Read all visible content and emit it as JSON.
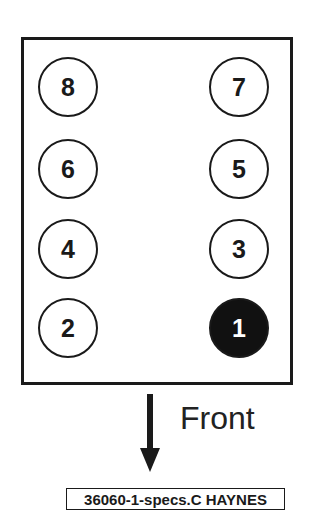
{
  "diagram": {
    "type": "cylinder-numbering",
    "cylinders": [
      {
        "number": "8",
        "column": "left",
        "row": 1,
        "highlighted": false
      },
      {
        "number": "7",
        "column": "right",
        "row": 1,
        "highlighted": false
      },
      {
        "number": "6",
        "column": "left",
        "row": 2,
        "highlighted": false
      },
      {
        "number": "5",
        "column": "right",
        "row": 2,
        "highlighted": false
      },
      {
        "number": "4",
        "column": "left",
        "row": 3,
        "highlighted": false
      },
      {
        "number": "3",
        "column": "right",
        "row": 3,
        "highlighted": false
      },
      {
        "number": "2",
        "column": "left",
        "row": 4,
        "highlighted": false
      },
      {
        "number": "1",
        "column": "right",
        "row": 4,
        "highlighted": true
      }
    ],
    "direction_label": "Front",
    "arrow_icon": "arrow-down-icon",
    "reference": "36060-1-specs.C HAYNES",
    "colors": {
      "stroke": "#1a1a1a",
      "highlight_fill": "#111111",
      "background": "#ffffff"
    }
  }
}
